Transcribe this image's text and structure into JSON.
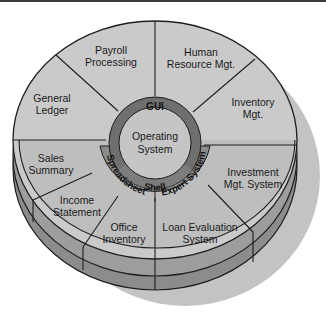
{
  "diagram": {
    "type": "layered-disk",
    "core": {
      "line1": "Operating",
      "line2": "System"
    },
    "rings": {
      "gui": "GUI",
      "shell": "Shell",
      "spreadsheet": "Spreadsheet",
      "expert_system": "Expert System"
    },
    "segments": [
      {
        "id": "payroll",
        "line1": "Payroll",
        "line2": "Processing"
      },
      {
        "id": "human-resource",
        "line1": "Human",
        "line2": "Resource Mgt."
      },
      {
        "id": "general-ledger",
        "line1": "General",
        "line2": "Ledger"
      },
      {
        "id": "inventory",
        "line1": "Inventory",
        "line2": "Mgt."
      },
      {
        "id": "sales-summary",
        "line1": "Sales",
        "line2": "Summary"
      },
      {
        "id": "income-statement",
        "line1": "Income",
        "line2": "Statement"
      },
      {
        "id": "office-inventory",
        "line1": "Office",
        "line2": "Inventory"
      },
      {
        "id": "loan-evaluation",
        "line1": "Loan Evaluation",
        "line2": "System"
      },
      {
        "id": "investment",
        "line1": "Investment",
        "line2": "Mgt. System"
      }
    ],
    "colors": {
      "upper_face": "#c9c9c9",
      "lower_face": "#bdbdbd",
      "gui_ring": "#6f6f6f",
      "core": "#c4c4c4",
      "lower_ring": "#8a8a8a",
      "side_upper": "#9c9c9c",
      "side_lower": "#8c8c8c",
      "shadow": "#c2c2c2",
      "outline": "#1e1e1e"
    }
  }
}
